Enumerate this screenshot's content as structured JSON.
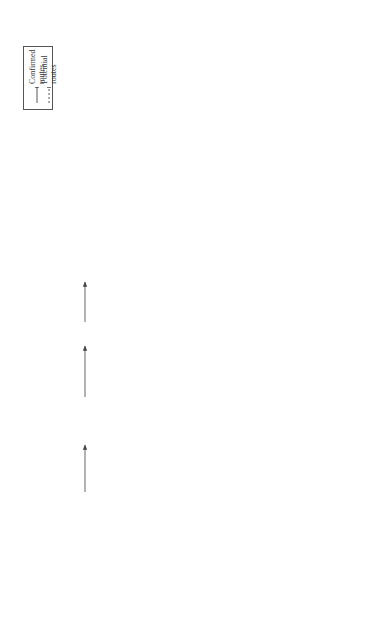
{
  "legend": {
    "confirmed": "Confirmed routes",
    "potential": "Potential routes"
  },
  "stages": {
    "exposure": "Exposure media",
    "uptake": "Uptake pathways",
    "translocation_line1": "Translocation",
    "translocation_line2": "and distribution",
    "excretory": "Excretory pathways"
  },
  "exposure_media": {
    "food_water": "Food, water",
    "air": "Air",
    "drug_delivery": "Drug delivery",
    "air_water_clothes": "Air, water, clothes"
  },
  "uptake_labels": {
    "ingestion": "Ingestion",
    "inhalation": "Inhalation",
    "injection": "Injection",
    "deposition": "Deposition"
  },
  "organs": {
    "gi_tract": "GI tract",
    "liver": "Liver",
    "lymph_top": "Lymph",
    "respiratory_tract": "Respiratory tract",
    "nasal": "Nasal",
    "tracheobronchial_1": "Tracheo-",
    "tracheobronchial_2": "bronchial",
    "alveolar": "Alveolar",
    "skin": "Skin",
    "cns": "CNS",
    "pns": "PNS",
    "lymph_bottom": "Lymph",
    "heart": "Heart",
    "spleen": "Spleen",
    "kidney": "Kidney",
    "other_sites_1": "Other sites",
    "other_sites_2": "(e.g., muscle, placenta)",
    "bone_marrow": "Bone marrow"
  },
  "blood": {
    "line1": "Blood",
    "line2": "(platelets, monocytes,",
    "line3": "endothelial cells)"
  },
  "excretion": {
    "feces": "Feces",
    "breast_milk": "Breast milk",
    "urine": "Urine",
    "sweat": "Sweat/exfoliation"
  },
  "route_labels": {
    "neurons_1": "Neurons",
    "neurons_2": "Neurons",
    "neurons_3": "Neurons"
  },
  "colors": {
    "line": "#555555",
    "text": "#333333",
    "background": "#ffffff"
  }
}
